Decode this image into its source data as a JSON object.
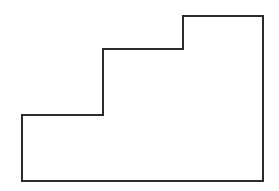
{
  "diagram": {
    "type": "polygon-outline",
    "stroke_color": "#2b2b2b",
    "fill_color": "#ffffff",
    "stroke_width": 2,
    "points": [
      [
        22,
        181
      ],
      [
        22,
        115
      ],
      [
        103,
        115
      ],
      [
        103,
        49
      ],
      [
        183,
        49
      ],
      [
        183,
        16
      ],
      [
        263,
        16
      ],
      [
        263,
        181
      ]
    ]
  }
}
